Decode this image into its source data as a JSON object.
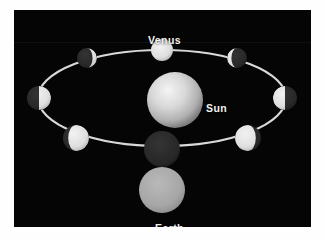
{
  "figure": {
    "domain": "Diagram",
    "title_visible": false,
    "background_color": "#050505",
    "frame_color": "#fefefe",
    "panel": {
      "x": 14,
      "y": 10,
      "width": 297,
      "height": 217
    }
  },
  "labels": {
    "venus": "Venus",
    "sun": "Sun",
    "earth": "Earth",
    "text_color": "#f2f2f2"
  },
  "orbit": {
    "name": "venus-orbit-ellipse",
    "center_x": 148,
    "center_y": 88,
    "radius_x": 124,
    "radius_y": 48,
    "stroke_color": "#d9d9d9",
    "stroke_width": 2.2
  },
  "sun": {
    "name": "sun",
    "center_x": 161,
    "center_y": 90,
    "radius": 28,
    "core_color": "#efefef",
    "mid_color": "#cfcfcf",
    "edge_color": "#8e8e8e"
  },
  "earth": {
    "name": "earth",
    "center_x": 148,
    "center_y": 180,
    "radius": 23,
    "color": "#a9a9a9",
    "edge_color": "#8d8d8d"
  },
  "lit_color": "#e8e8e8",
  "dark_color": "#2a2a2a",
  "venus_positions": [
    {
      "id": "venus-full-top",
      "phase": "full",
      "center_x": 148,
      "center_y": 40,
      "radius": 11,
      "lit_fraction": 1.0,
      "terminator_offset": 0,
      "lit_side": "all"
    },
    {
      "id": "venus-gibbous-upper-left",
      "phase": "gibbous",
      "center_x": 73,
      "center_y": 48,
      "radius": 10,
      "lit_fraction": 0.78,
      "terminator_offset": -5.6,
      "lit_side": "right"
    },
    {
      "id": "venus-gibbous-upper-right",
      "phase": "gibbous",
      "center_x": 223,
      "center_y": 48,
      "radius": 10,
      "lit_fraction": 0.78,
      "terminator_offset": 5.6,
      "lit_side": "left"
    },
    {
      "id": "venus-half-left",
      "phase": "half",
      "center_x": 25,
      "center_y": 88,
      "radius": 12,
      "lit_fraction": 0.5,
      "terminator_offset": 0,
      "lit_side": "right"
    },
    {
      "id": "venus-half-right",
      "phase": "half",
      "center_x": 271,
      "center_y": 88,
      "radius": 12,
      "lit_fraction": 0.5,
      "terminator_offset": 0,
      "lit_side": "left"
    },
    {
      "id": "venus-crescent-lower-left",
      "phase": "crescent",
      "center_x": 62,
      "center_y": 128,
      "radius": 13,
      "lit_fraction": 0.2,
      "terminator_offset": 7.8,
      "lit_side": "right"
    },
    {
      "id": "venus-crescent-lower-right",
      "phase": "crescent",
      "center_x": 234,
      "center_y": 128,
      "radius": 13,
      "lit_fraction": 0.2,
      "terminator_offset": -7.8,
      "lit_side": "left"
    },
    {
      "id": "venus-new-bottom",
      "phase": "new",
      "center_x": 148,
      "center_y": 139,
      "radius": 18,
      "lit_fraction": 0.0,
      "terminator_offset": 0,
      "lit_side": "none"
    }
  ]
}
